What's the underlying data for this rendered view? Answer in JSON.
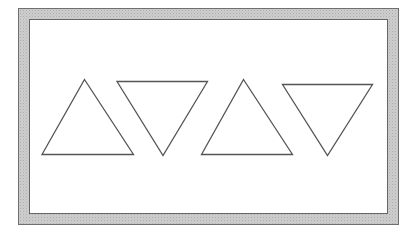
{
  "canvas": {
    "width": 417,
    "height": 232,
    "background": "#ffffff"
  },
  "frame": {
    "outline_color": "#6f6f6f",
    "inner_outline_color": "#666666",
    "band_color": "#cdcdcd",
    "band_stipple_color": "#aeaeae",
    "inner_background": "#ffffff"
  },
  "shapes": [
    {
      "name": "triangle-up-1",
      "type": "triangle",
      "orientation": "up",
      "points": "84.5,79.5 133.5,154.5 42,154.5",
      "stroke": "#545454",
      "stroke_width": 1.3,
      "fill": "none"
    },
    {
      "name": "triangle-down-1",
      "type": "triangle",
      "orientation": "down",
      "points": "117,81.5 207.5,81.5 163,155.5",
      "stroke": "#545454",
      "stroke_width": 1.3,
      "fill": "none"
    },
    {
      "name": "triangle-up-2",
      "type": "triangle",
      "orientation": "up",
      "points": "243.5,79.5 292.5,154.5 201.5,154.5",
      "stroke": "#545454",
      "stroke_width": 1.3,
      "fill": "none"
    },
    {
      "name": "triangle-down-2",
      "type": "triangle",
      "orientation": "down",
      "points": "282.5,84.5 372.5,84.5 327.5,155.5",
      "stroke": "#545454",
      "stroke_width": 1.3,
      "fill": "none"
    }
  ]
}
